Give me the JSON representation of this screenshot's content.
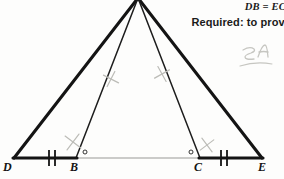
{
  "document": {
    "type": "geometry-proof-figure",
    "background_color": "#fdfdfc",
    "ink_color": "#141414",
    "pencil_color": "#b9b9b4",
    "inner_line_color": "#9a9a96"
  },
  "problem_text": {
    "given_statement": "DB = EC",
    "required_statement": "Required: to prove"
  },
  "annotations": {
    "handwritten_note": "SA"
  },
  "figure": {
    "vertices": [
      {
        "name": "A",
        "label": "A",
        "x": 138,
        "y": -2,
        "visible_label": false
      },
      {
        "name": "D",
        "label": "D",
        "x": 14,
        "y": 158,
        "visible_label": true
      },
      {
        "name": "B",
        "label": "B",
        "x": 76,
        "y": 158,
        "visible_label": true
      },
      {
        "name": "C",
        "label": "C",
        "x": 200,
        "y": 158,
        "visible_label": true
      },
      {
        "name": "E",
        "label": "E",
        "x": 262,
        "y": 158,
        "visible_label": true
      }
    ],
    "segments": [
      {
        "name": "AD",
        "from": "A",
        "to": "D",
        "weight": "thick",
        "color": "#141414"
      },
      {
        "name": "AE",
        "from": "A",
        "to": "E",
        "weight": "thick",
        "color": "#141414"
      },
      {
        "name": "AB",
        "from": "A",
        "to": "B",
        "weight": "thin",
        "color": "#1d1d1d"
      },
      {
        "name": "AC",
        "from": "A",
        "to": "C",
        "weight": "thin",
        "color": "#1d1d1d"
      },
      {
        "name": "DB",
        "from": "D",
        "to": "B",
        "weight": "thick",
        "color": "#141414"
      },
      {
        "name": "BC",
        "from": "B",
        "to": "C",
        "weight": "hair",
        "color": "#9a9a96"
      },
      {
        "name": "CE",
        "from": "C",
        "to": "E",
        "weight": "thick",
        "color": "#141414"
      }
    ],
    "tick_marks": [
      {
        "name": "tick-DB",
        "on_segment": "DB",
        "count": 2,
        "x": 52,
        "y": 158,
        "ink": "print"
      },
      {
        "name": "tick-CE",
        "on_segment": "CE",
        "count": 2,
        "x": 224,
        "y": 158,
        "ink": "print"
      }
    ],
    "angle_markers": [
      {
        "name": "angle-ABC",
        "at_vertex": "B",
        "symbol": "circle",
        "x": 85,
        "y": 152
      },
      {
        "name": "angle-ACB",
        "at_vertex": "C",
        "symbol": "circle",
        "x": 191,
        "y": 152
      }
    ],
    "pencil_marks": [
      {
        "name": "pencil-x-AB",
        "x": 111,
        "y": 79,
        "rotation": -18
      },
      {
        "name": "pencil-x-AC",
        "x": 162,
        "y": 74,
        "rotation": 16
      },
      {
        "name": "pencil-x-angle-B",
        "x": 73,
        "y": 142,
        "rotation": -8
      },
      {
        "name": "pencil-x-angle-C",
        "x": 207,
        "y": 145,
        "rotation": 8
      }
    ]
  }
}
